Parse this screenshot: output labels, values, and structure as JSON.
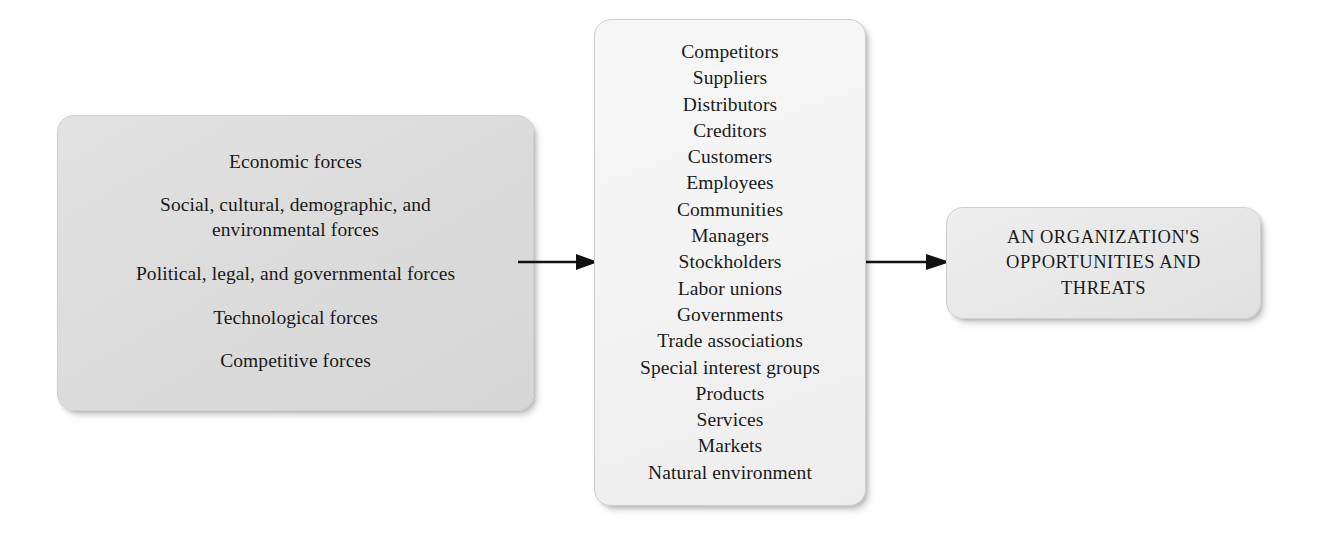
{
  "diagram": {
    "type": "flow",
    "background_color": "#ffffff"
  },
  "forces_box": {
    "name": "external-forces",
    "fill_color": "#dcdcdc",
    "items": [
      "Economic forces",
      "Social, cultural, demographic, and\nenvironmental forces",
      "Political, legal, and governmental forces",
      "Technological forces",
      "Competitive forces"
    ]
  },
  "stakeholders_box": {
    "name": "competitive-and-stakeholder-entities",
    "fill_color": "#f4f4f4",
    "items": [
      "Competitors",
      "Suppliers",
      "Distributors",
      "Creditors",
      "Customers",
      "Employees",
      "Communities",
      "Managers",
      "Stockholders",
      "Labor unions",
      "Governments",
      "Trade associations",
      "Special interest groups",
      "Products",
      "Services",
      "Markets",
      "Natural environment"
    ]
  },
  "outcome_box": {
    "name": "organization-opportunities-and-threats",
    "fill_color": "#e8e8e8",
    "lines": [
      "AN ORGANIZATION'S",
      "OPPORTUNITIES AND",
      "THREATS"
    ]
  },
  "arrows": {
    "forces_to_stakeholders": {
      "icon": "arrow-right-icon",
      "color": "#111111"
    },
    "stakeholders_to_outcome": {
      "icon": "arrow-right-icon",
      "color": "#111111"
    }
  }
}
